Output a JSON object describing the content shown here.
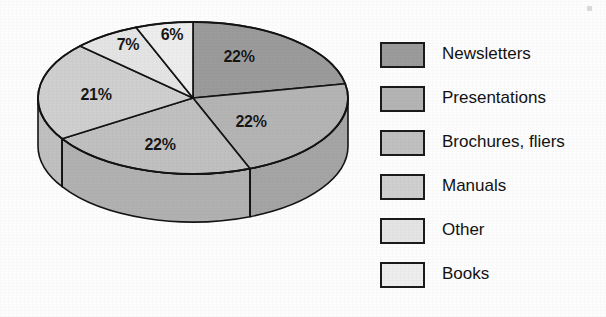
{
  "chart_data": {
    "type": "pie",
    "title": "",
    "subtitle": "",
    "xlabel": "",
    "ylabel": "",
    "legend_position": "right",
    "grid": false,
    "three_d": true,
    "start_angle_deg": 0,
    "direction": "clockwise",
    "categories": [
      "Newsletters",
      "Presentations",
      "Brochures, fliers",
      "Manuals",
      "Other",
      "Books"
    ],
    "values": [
      22,
      22,
      22,
      21,
      7,
      6
    ],
    "unit": "%",
    "data_labels": [
      "22%",
      "22%",
      "22%",
      "21%",
      "7%",
      "6%"
    ],
    "slice_colors": [
      "#9b9b9b",
      "#b4b4b4",
      "#c0c0c0",
      "#cfcfcf",
      "#e4e4e4",
      "#ededed"
    ],
    "slice_side_colors": [
      "#8b8b8b",
      "#a5a5a5",
      "#b1b1b1",
      "#c0c0c0",
      "#d4d4d4",
      "#dedede"
    ],
    "outline_color": "#141414",
    "background_color": "#fdfdfd",
    "slices": [
      {
        "label": "Newsletters",
        "value": 22,
        "data_label": "22%",
        "color": "#9b9b9b"
      },
      {
        "label": "Presentations",
        "value": 22,
        "data_label": "22%",
        "color": "#b4b4b4"
      },
      {
        "label": "Brochures, fliers",
        "value": 22,
        "data_label": "22%",
        "color": "#c0c0c0"
      },
      {
        "label": "Manuals",
        "value": 21,
        "data_label": "21%",
        "color": "#cfcfcf"
      },
      {
        "label": "Other",
        "value": 7,
        "data_label": "7%",
        "color": "#e4e4e4"
      },
      {
        "label": "Books",
        "value": 6,
        "data_label": "6%",
        "color": "#ededed"
      }
    ]
  },
  "chart": {
    "labels": [
      {
        "text": "22%",
        "x": 239,
        "y": 57
      },
      {
        "text": "22%",
        "x": 251,
        "y": 122
      },
      {
        "text": "22%",
        "x": 160,
        "y": 145
      },
      {
        "text": "21%",
        "x": 96,
        "y": 95
      },
      {
        "text": "7%",
        "x": 128,
        "y": 45
      },
      {
        "text": "6%",
        "x": 172,
        "y": 35
      }
    ]
  },
  "legend": {
    "items": [
      {
        "label": "Newsletters",
        "color": "#9b9b9b"
      },
      {
        "label": "Presentations",
        "color": "#b4b4b4"
      },
      {
        "label": "Brochures, fliers",
        "color": "#c0c0c0"
      },
      {
        "label": "Manuals",
        "color": "#cfcfcf"
      },
      {
        "label": "Other",
        "color": "#e4e4e4"
      },
      {
        "label": "Books",
        "color": "#ededed"
      }
    ]
  }
}
